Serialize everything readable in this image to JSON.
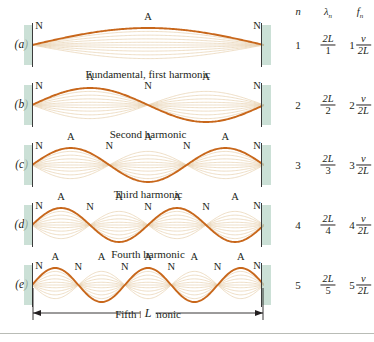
{
  "figure": {
    "colors": {
      "wave": "#c8671b",
      "ghost": "#e8d3b4",
      "wall_fill": "#b9d6c8",
      "wall_edge": "#3c3c3c",
      "text": "#231f20",
      "rule": "#b9bcb6"
    },
    "node_label": "N",
    "antinode_label": "A",
    "length_label": "L",
    "bottom_rule": true
  },
  "panels": [
    {
      "id": "a",
      "label": "(a)",
      "caption": "Fundamental, first harmonic",
      "harmonic": 1,
      "nodes": 2,
      "antinodes": 1,
      "marks": [
        {
          "type": "N",
          "pos": 0.0
        },
        {
          "type": "A",
          "pos": 0.5
        },
        {
          "type": "N",
          "pos": 1.0
        }
      ]
    },
    {
      "id": "b",
      "label": "(b)",
      "caption": "Second harmonic",
      "harmonic": 2,
      "nodes": 3,
      "antinodes": 2,
      "marks": [
        {
          "type": "N",
          "pos": 0.0
        },
        {
          "type": "A",
          "pos": 0.25
        },
        {
          "type": "N",
          "pos": 0.5
        },
        {
          "type": "A",
          "pos": 0.75
        },
        {
          "type": "N",
          "pos": 1.0
        }
      ]
    },
    {
      "id": "c",
      "label": "(c)",
      "caption": "Third harmonic",
      "harmonic": 3,
      "nodes": 4,
      "antinodes": 3,
      "marks": [
        {
          "type": "N",
          "pos": 0.0
        },
        {
          "type": "A",
          "pos": 0.1667
        },
        {
          "type": "N",
          "pos": 0.3333
        },
        {
          "type": "A",
          "pos": 0.5
        },
        {
          "type": "N",
          "pos": 0.6667
        },
        {
          "type": "A",
          "pos": 0.8333
        },
        {
          "type": "N",
          "pos": 1.0
        }
      ]
    },
    {
      "id": "d",
      "label": "(d)",
      "caption": "Fourth harmonic",
      "harmonic": 4,
      "nodes": 5,
      "antinodes": 4,
      "marks": [
        {
          "type": "N",
          "pos": 0.0
        },
        {
          "type": "A",
          "pos": 0.125
        },
        {
          "type": "N",
          "pos": 0.25
        },
        {
          "type": "A",
          "pos": 0.375
        },
        {
          "type": "N",
          "pos": 0.5
        },
        {
          "type": "A",
          "pos": 0.625
        },
        {
          "type": "N",
          "pos": 0.75
        },
        {
          "type": "A",
          "pos": 0.875
        },
        {
          "type": "N",
          "pos": 1.0
        }
      ]
    },
    {
      "id": "e",
      "label": "(e)",
      "caption": "Fifth harmonic",
      "harmonic": 5,
      "nodes": 6,
      "antinodes": 5,
      "marks": [
        {
          "type": "N",
          "pos": 0.0
        },
        {
          "type": "A",
          "pos": 0.1
        },
        {
          "type": "N",
          "pos": 0.2
        },
        {
          "type": "A",
          "pos": 0.3
        },
        {
          "type": "N",
          "pos": 0.4
        },
        {
          "type": "A",
          "pos": 0.5
        },
        {
          "type": "N",
          "pos": 0.6
        },
        {
          "type": "A",
          "pos": 0.7
        },
        {
          "type": "N",
          "pos": 0.8
        },
        {
          "type": "A",
          "pos": 0.9
        },
        {
          "type": "N",
          "pos": 1.0
        }
      ]
    }
  ],
  "table": {
    "headers": {
      "n": "n",
      "lambda": "λ",
      "lambda_sub": "n",
      "f": "f",
      "f_sub": "n"
    },
    "rows": [
      {
        "n": "1",
        "lambda_num": "2L",
        "lambda_den": "1",
        "f_lead": "1",
        "f_num": "v",
        "f_den": "2L"
      },
      {
        "n": "2",
        "lambda_num": "2L",
        "lambda_den": "2",
        "f_lead": "2",
        "f_num": "v",
        "f_den": "2L"
      },
      {
        "n": "3",
        "lambda_num": "2L",
        "lambda_den": "3",
        "f_lead": "3",
        "f_num": "v",
        "f_den": "2L"
      },
      {
        "n": "4",
        "lambda_num": "2L",
        "lambda_den": "4",
        "f_lead": "4",
        "f_num": "v",
        "f_den": "2L"
      },
      {
        "n": "5",
        "lambda_num": "2L",
        "lambda_den": "5",
        "f_lead": "5",
        "f_num": "v",
        "f_den": "2L"
      }
    ]
  }
}
